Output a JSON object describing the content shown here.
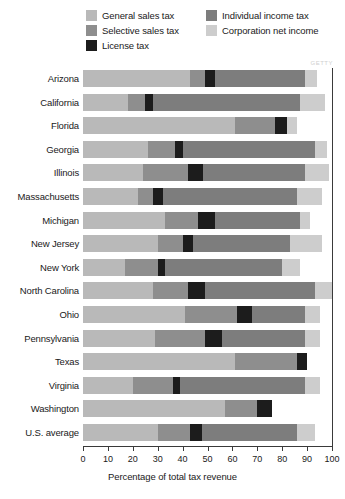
{
  "legend": {
    "items": [
      {
        "label": "General sales tax",
        "color": "#b9b9b9",
        "key": "general_sales_tax"
      },
      {
        "label": "Individual income tax",
        "color": "#7d7d7d",
        "key": "individual_income_tax"
      },
      {
        "label": "Selective sales tax",
        "color": "#8e8e8e",
        "key": "selective_sales_tax"
      },
      {
        "label": "Corporation net income",
        "color": "#cdcdcd",
        "key": "corporation_net_income"
      },
      {
        "label": "License tax",
        "color": "#1c1c1c",
        "key": "license_tax"
      }
    ]
  },
  "axis": {
    "x_title": "Percentage of total tax revenue",
    "x_ticks": [
      "0",
      "10",
      "20",
      "30",
      "40",
      "50",
      "60",
      "70",
      "80",
      "90",
      "100"
    ],
    "x_min": 0,
    "x_max": 100
  },
  "watermark": "GETTY",
  "chart_data": {
    "type": "bar",
    "orientation": "horizontal",
    "stacked": true,
    "title": "",
    "xlabel": "Percentage of total tax revenue",
    "ylabel": "",
    "xlim": [
      0,
      100
    ],
    "grid": true,
    "legend_position": "top",
    "categories": [
      "Arizona",
      "California",
      "Florida",
      "Georgia",
      "Illinois",
      "Massachusetts",
      "Michigan",
      "New Jersey",
      "New York",
      "North Carolina",
      "Ohio",
      "Pennsylvania",
      "Texas",
      "Virginia",
      "Washington",
      "U.S. average"
    ],
    "series": [
      {
        "name": "General sales tax",
        "color": "#b9b9b9",
        "values": [
          43,
          18,
          61,
          26,
          24,
          22,
          33,
          30,
          17,
          28,
          41,
          29,
          61,
          20,
          57,
          30
        ]
      },
      {
        "name": "Selective sales tax",
        "color": "#8e8e8e",
        "values": [
          6,
          7,
          16,
          11,
          18,
          6,
          13,
          10,
          13,
          14,
          21,
          20,
          25,
          16,
          13,
          13
        ]
      },
      {
        "name": "License tax",
        "color": "#1c1c1c",
        "values": [
          4,
          3,
          5,
          3,
          6,
          4,
          7,
          4,
          3,
          7,
          6,
          7,
          4,
          3,
          6,
          5
        ]
      },
      {
        "name": "Individual income tax",
        "color": "#7d7d7d",
        "values": [
          36,
          59,
          0,
          53,
          41,
          54,
          34,
          39,
          47,
          44,
          21,
          33,
          0,
          50,
          0,
          38
        ]
      },
      {
        "name": "Corporation net income",
        "color": "#cdcdcd",
        "values": [
          5,
          10,
          4,
          5,
          10,
          10,
          4,
          13,
          7,
          7,
          6,
          6,
          0,
          6,
          0,
          7
        ]
      }
    ]
  }
}
